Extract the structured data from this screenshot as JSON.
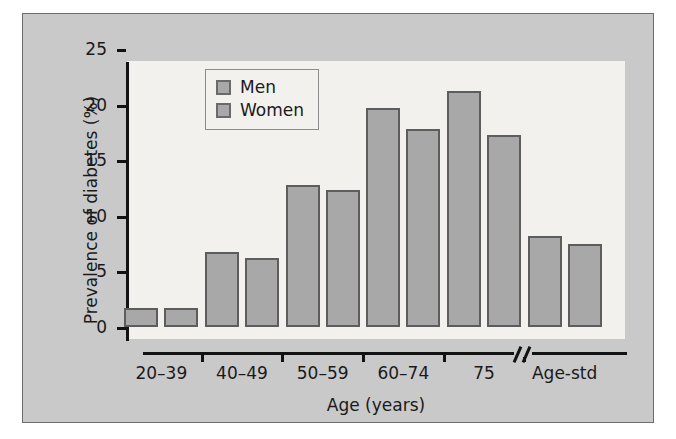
{
  "figure": {
    "background_color": "#c9c9c9",
    "panel_color": "#f2f1ee",
    "bar_fill": "#a8a8a8",
    "bar_stroke": "#5d5d5d"
  },
  "legend": {
    "position": "top-left-inside",
    "entries": [
      {
        "label": "Men",
        "color": "#a8a8a8"
      },
      {
        "label": "Women",
        "color": "#a8a8a8"
      }
    ]
  },
  "axis": {
    "y_ticks": [
      "0",
      "5",
      "10",
      "15",
      "20",
      "25"
    ],
    "x_break_before": "Age-std"
  },
  "chart_data": {
    "type": "bar",
    "title": "",
    "xlabel": "Age (years)",
    "ylabel": "Prevalence of diabetes (%)",
    "categories": [
      "20–39",
      "40–49",
      "50–59",
      "60–74",
      "75",
      "Age-std"
    ],
    "series": [
      {
        "name": "Men",
        "values": [
          1.7,
          6.7,
          12.8,
          19.7,
          21.2,
          8.2
        ]
      },
      {
        "name": "Women",
        "values": [
          1.7,
          6.2,
          12.3,
          17.8,
          17.3,
          7.5
        ]
      }
    ],
    "ylim": [
      0,
      25
    ],
    "ytick_step": 5,
    "grid": false,
    "legend_position": "upper left"
  }
}
